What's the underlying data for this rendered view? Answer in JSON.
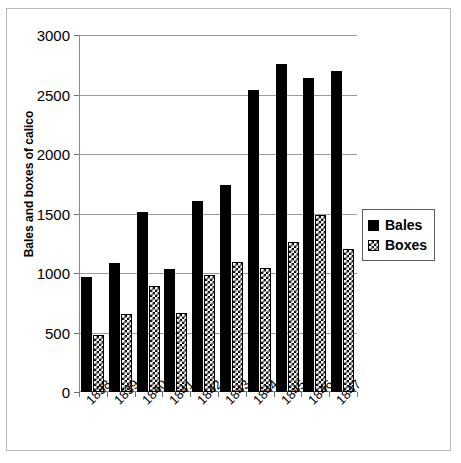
{
  "chart_data": {
    "type": "bar",
    "title": "",
    "subtitle": "",
    "xlabel": "",
    "ylabel": "Bales and boxes of calico",
    "categories": [
      "1838",
      "1839",
      "1840",
      "1841",
      "1842",
      "1843",
      "1844",
      "1845",
      "1846",
      "1847"
    ],
    "series": [
      {
        "name": "Bales",
        "color": "#000000",
        "pattern": "solid",
        "values": [
          965,
          1080,
          1515,
          1035,
          1605,
          1740,
          2535,
          2760,
          2635,
          2695
        ]
      },
      {
        "name": "Boxes",
        "color": "#000000",
        "pattern": "checkerboard",
        "values": [
          480,
          655,
          890,
          665,
          985,
          1095,
          1040,
          1260,
          1490,
          1200
        ]
      }
    ],
    "ylim": [
      0,
      3000
    ],
    "yticks": [
      0,
      500,
      1000,
      1500,
      2000,
      2500,
      3000
    ],
    "ytick_labels": [
      "0",
      "500",
      "1000",
      "1500",
      "2000",
      "2500",
      "3000"
    ],
    "grid": true,
    "grid_axis": "y",
    "legend_position": "right",
    "xtick_rotation": -45
  },
  "legend": {
    "items": [
      {
        "label": "Bales",
        "swatch": "solid-black-square-icon"
      },
      {
        "label": "Boxes",
        "swatch": "checkered-square-icon"
      }
    ]
  },
  "axes": {
    "y_title": "Bales and boxes of calico"
  }
}
